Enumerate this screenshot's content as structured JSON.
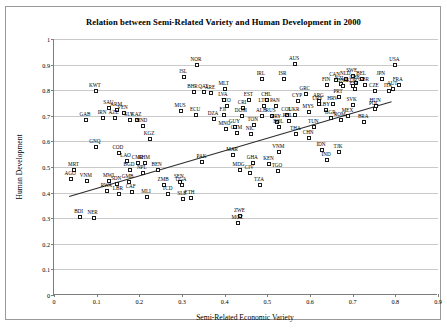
{
  "chart_data": {
    "type": "scatter",
    "title": "Relation between Semi-Related Variety and Human Development in 2000",
    "xlabel": "Semi-Related Economic Variety",
    "ylabel": "Human Development",
    "xlim": [
      0,
      0.9
    ],
    "ylim": [
      0,
      1
    ],
    "xticks": [
      "0",
      "0.1",
      "0.2",
      "0.3",
      "0.4",
      "0.5",
      "0.6",
      "0.7",
      "0.8",
      "0.9"
    ],
    "yticks": [
      "0",
      "0.1",
      "0.2",
      "0.3",
      "0.4",
      "0.5",
      "0.6",
      "0.7",
      "0.8",
      "0.9",
      "1"
    ],
    "grid": "horizontal",
    "legend": "none",
    "marker": "open-square",
    "trendline": {
      "x0": 0.035,
      "y0": 0.385,
      "x1": 0.79,
      "y1": 0.755
    },
    "points": [
      {
        "label": "ISL",
        "x": 0.305,
        "y": 0.853
      },
      {
        "label": "NOR",
        "x": 0.335,
        "y": 0.898
      },
      {
        "label": "AUS",
        "x": 0.565,
        "y": 0.903
      },
      {
        "label": "USA",
        "x": 0.8,
        "y": 0.898
      },
      {
        "label": "SWE",
        "x": 0.7,
        "y": 0.855
      },
      {
        "label": "CAN",
        "x": 0.66,
        "y": 0.838
      },
      {
        "label": "NLD",
        "x": 0.685,
        "y": 0.845
      },
      {
        "label": "BEL",
        "x": 0.722,
        "y": 0.845
      },
      {
        "label": "JPN",
        "x": 0.768,
        "y": 0.842
      },
      {
        "label": "FIN",
        "x": 0.64,
        "y": 0.822
      },
      {
        "label": "CHE",
        "x": 0.707,
        "y": 0.827
      },
      {
        "label": "NZL",
        "x": 0.672,
        "y": 0.825
      },
      {
        "label": "DNK",
        "x": 0.678,
        "y": 0.818
      },
      {
        "label": "KOR",
        "x": 0.7,
        "y": 0.815
      },
      {
        "label": "GBR",
        "x": 0.728,
        "y": 0.82
      },
      {
        "label": "FRA",
        "x": 0.808,
        "y": 0.822
      },
      {
        "label": "AUT",
        "x": 0.795,
        "y": 0.803
      },
      {
        "label": "ESP",
        "x": 0.705,
        "y": 0.803
      },
      {
        "label": "ITA",
        "x": 0.785,
        "y": 0.795
      },
      {
        "label": "CZE",
        "x": 0.752,
        "y": 0.795
      },
      {
        "label": "IRL",
        "x": 0.487,
        "y": 0.845
      },
      {
        "label": "ISR",
        "x": 0.538,
        "y": 0.843
      },
      {
        "label": "MLT",
        "x": 0.4,
        "y": 0.803
      },
      {
        "label": "BHR",
        "x": 0.327,
        "y": 0.793
      },
      {
        "label": "QAT",
        "x": 0.352,
        "y": 0.793
      },
      {
        "label": "ARE",
        "x": 0.368,
        "y": 0.79
      },
      {
        "label": "KWT",
        "x": 0.098,
        "y": 0.795
      },
      {
        "label": "GRC",
        "x": 0.59,
        "y": 0.785
      },
      {
        "label": "PRT",
        "x": 0.668,
        "y": 0.775
      },
      {
        "label": "LVA",
        "x": 0.398,
        "y": 0.762
      },
      {
        "label": "EST",
        "x": 0.458,
        "y": 0.762
      },
      {
        "label": "CHL",
        "x": 0.5,
        "y": 0.76
      },
      {
        "label": "CYP",
        "x": 0.572,
        "y": 0.758
      },
      {
        "label": "ARG",
        "x": 0.622,
        "y": 0.758
      },
      {
        "label": "LTU",
        "x": 0.493,
        "y": 0.74
      },
      {
        "label": "PAN",
        "x": 0.52,
        "y": 0.738
      },
      {
        "label": "TTO",
        "x": 0.405,
        "y": 0.737
      },
      {
        "label": "SAU",
        "x": 0.13,
        "y": 0.73
      },
      {
        "label": "ARM",
        "x": 0.148,
        "y": 0.723
      },
      {
        "label": "CRI",
        "x": 0.443,
        "y": 0.73
      },
      {
        "label": "HRV",
        "x": 0.655,
        "y": 0.745
      },
      {
        "label": "SVK",
        "x": 0.7,
        "y": 0.742
      },
      {
        "label": "URY",
        "x": 0.62,
        "y": 0.745
      },
      {
        "label": "HUN",
        "x": 0.755,
        "y": 0.74
      },
      {
        "label": "POL",
        "x": 0.752,
        "y": 0.727
      },
      {
        "label": "VEN",
        "x": 0.163,
        "y": 0.71
      },
      {
        "label": "MUS",
        "x": 0.298,
        "y": 0.717
      },
      {
        "label": "ECU",
        "x": 0.333,
        "y": 0.705
      },
      {
        "label": "FJI",
        "x": 0.398,
        "y": 0.705
      },
      {
        "label": "MYS",
        "x": 0.598,
        "y": 0.715
      },
      {
        "label": "LBY",
        "x": 0.637,
        "y": 0.723
      },
      {
        "label": "DOM",
        "x": 0.44,
        "y": 0.7
      },
      {
        "label": "ALB",
        "x": 0.488,
        "y": 0.7
      },
      {
        "label": "RUS",
        "x": 0.51,
        "y": 0.7
      },
      {
        "label": "COL",
        "x": 0.547,
        "y": 0.705
      },
      {
        "label": "UKR",
        "x": 0.565,
        "y": 0.705
      },
      {
        "label": "BGR",
        "x": 0.65,
        "y": 0.69
      },
      {
        "label": "MEX",
        "x": 0.69,
        "y": 0.7
      },
      {
        "label": "ROM",
        "x": 0.672,
        "y": 0.682
      },
      {
        "label": "IRN",
        "x": 0.115,
        "y": 0.692
      },
      {
        "label": "AZE",
        "x": 0.142,
        "y": 0.69
      },
      {
        "label": "GAB",
        "x": 0.075,
        "y": 0.685
      },
      {
        "label": "DZA",
        "x": 0.375,
        "y": 0.688
      },
      {
        "label": "SLV",
        "x": 0.178,
        "y": 0.683
      },
      {
        "label": "KAZ",
        "x": 0.195,
        "y": 0.683
      },
      {
        "label": "PRY",
        "x": 0.523,
        "y": 0.675
      },
      {
        "label": "PHL",
        "x": 0.55,
        "y": 0.678
      },
      {
        "label": "BRA",
        "x": 0.727,
        "y": 0.675
      },
      {
        "label": "TON",
        "x": 0.468,
        "y": 0.663
      },
      {
        "label": "HND",
        "x": 0.208,
        "y": 0.662
      },
      {
        "label": "GUY",
        "x": 0.425,
        "y": 0.657
      },
      {
        "label": "BOL",
        "x": 0.528,
        "y": 0.655
      },
      {
        "label": "TUN",
        "x": 0.61,
        "y": 0.657
      },
      {
        "label": "MNG",
        "x": 0.402,
        "y": 0.65
      },
      {
        "label": "THA",
        "x": 0.568,
        "y": 0.628
      },
      {
        "label": "CHN",
        "x": 0.598,
        "y": 0.613
      },
      {
        "label": "GTM",
        "x": 0.43,
        "y": 0.632
      },
      {
        "label": "NIC",
        "x": 0.462,
        "y": 0.63
      },
      {
        "label": "KGZ",
        "x": 0.225,
        "y": 0.608
      },
      {
        "label": "GNQ",
        "x": 0.098,
        "y": 0.577
      },
      {
        "label": "VNM",
        "x": 0.528,
        "y": 0.56
      },
      {
        "label": "IDN",
        "x": 0.628,
        "y": 0.565
      },
      {
        "label": "TJK",
        "x": 0.668,
        "y": 0.56
      },
      {
        "label": "IND",
        "x": 0.64,
        "y": 0.527
      },
      {
        "label": "MAR",
        "x": 0.42,
        "y": 0.545
      },
      {
        "label": "COD",
        "x": 0.152,
        "y": 0.555
      },
      {
        "label": "LAO",
        "x": 0.17,
        "y": 0.523
      },
      {
        "label": "CMR",
        "x": 0.198,
        "y": 0.517
      },
      {
        "label": "KHM",
        "x": 0.213,
        "y": 0.515
      },
      {
        "label": "PAK",
        "x": 0.348,
        "y": 0.52
      },
      {
        "label": "GHA",
        "x": 0.467,
        "y": 0.515
      },
      {
        "label": "KEN",
        "x": 0.505,
        "y": 0.51
      },
      {
        "label": "MRT",
        "x": 0.048,
        "y": 0.488
      },
      {
        "label": "BGD",
        "x": 0.178,
        "y": 0.49
      },
      {
        "label": "BEN",
        "x": 0.243,
        "y": 0.487
      },
      {
        "label": "NPL",
        "x": 0.208,
        "y": 0.478
      },
      {
        "label": "MDG",
        "x": 0.435,
        "y": 0.488
      },
      {
        "label": "CIV",
        "x": 0.46,
        "y": 0.477
      },
      {
        "label": "TGO",
        "x": 0.525,
        "y": 0.483
      },
      {
        "label": "AGO",
        "x": 0.04,
        "y": 0.455
      },
      {
        "label": "VNM2",
        "x": 0.077,
        "y": 0.447
      },
      {
        "label": "MWI",
        "x": 0.13,
        "y": 0.447
      },
      {
        "label": "GMB",
        "x": 0.175,
        "y": 0.443
      },
      {
        "label": "SDN",
        "x": 0.148,
        "y": 0.432
      },
      {
        "label": "SEN",
        "x": 0.295,
        "y": 0.44
      },
      {
        "label": "ZMB",
        "x": 0.258,
        "y": 0.428
      },
      {
        "label": "UGA",
        "x": 0.3,
        "y": 0.428
      },
      {
        "label": "TZA",
        "x": 0.483,
        "y": 0.43
      },
      {
        "label": "RWA",
        "x": 0.125,
        "y": 0.405
      },
      {
        "label": "LBR",
        "x": 0.152,
        "y": 0.395
      },
      {
        "label": "CAF",
        "x": 0.182,
        "y": 0.403
      },
      {
        "label": "MLI",
        "x": 0.218,
        "y": 0.382
      },
      {
        "label": "TCD",
        "x": 0.268,
        "y": 0.393
      },
      {
        "label": "SLE",
        "x": 0.302,
        "y": 0.375
      },
      {
        "label": "ETH",
        "x": 0.32,
        "y": 0.378
      },
      {
        "label": "ZWE",
        "x": 0.437,
        "y": 0.31
      },
      {
        "label": "MOZ",
        "x": 0.432,
        "y": 0.283
      },
      {
        "label": "BDI",
        "x": 0.06,
        "y": 0.303
      },
      {
        "label": "NER",
        "x": 0.093,
        "y": 0.3
      }
    ]
  }
}
